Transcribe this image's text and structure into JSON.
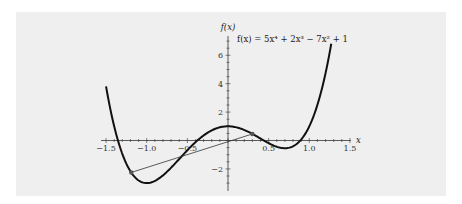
{
  "chart_data": {
    "type": "line",
    "title": "f(x) = 5x⁴ + 2x³ − 7x² + 1",
    "xlabel": "x",
    "ylabel": "f(x)",
    "xlim": [
      -1.55,
      1.55
    ],
    "ylim": [
      -3.5,
      7.2
    ],
    "grid": false,
    "x_ticks": [
      -1.5,
      -1.0,
      -0.5,
      0.5,
      1.0,
      1.5
    ],
    "x_tick_labels": [
      "−1.5",
      "−1.0",
      "−0.5",
      "0.5",
      "1.0",
      "1.5"
    ],
    "y_ticks": [
      -2,
      2,
      4,
      6
    ],
    "y_tick_labels": [
      "−2",
      "2",
      "4",
      "6"
    ],
    "series": [
      {
        "name": "f(x) = 5x^4 + 2x^3 - 7x^2 + 1",
        "function": "5x^4 + 2x^3 - 7x^2 + 1",
        "coefficients": [
          5,
          2,
          -7,
          0,
          1
        ],
        "x_range": [
          -1.5,
          1.27
        ],
        "color": "#111111",
        "stroke_width": 2
      },
      {
        "name": "secant",
        "type": "segment",
        "points": [
          [
            -1.19,
            -2.25
          ],
          [
            0.3,
            0.46
          ]
        ],
        "color": "#333333",
        "stroke_width": 0.8
      }
    ],
    "markers": [
      {
        "x": -1.19,
        "y": -2.25
      },
      {
        "x": 0.3,
        "y": 0.46
      }
    ]
  },
  "colors": {
    "background": "#ffffff",
    "panel": "#efefef",
    "curve": "#111111",
    "axis": "#333333",
    "marker": "#555555"
  }
}
